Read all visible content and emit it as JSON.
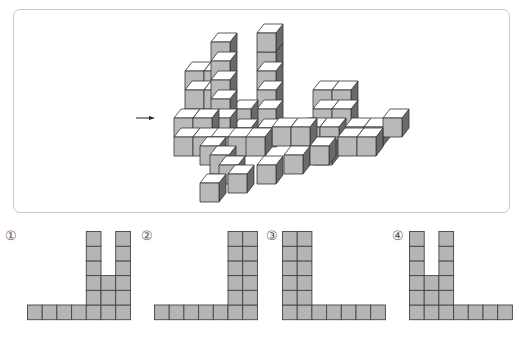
{
  "question": {
    "view_direction_arrow": "arrow-right",
    "cube_colors": {
      "front": "#b9b9b9",
      "top": "#ffffff",
      "side": "#6a6a6a",
      "edge": "#333333"
    },
    "cubes": [
      [
        257,
        52
      ],
      [
        257,
        71
      ],
      [
        257,
        90
      ],
      [
        257,
        109
      ],
      [
        257,
        128
      ],
      [
        257,
        33
      ],
      [
        185,
        71
      ],
      [
        204,
        71
      ],
      [
        185,
        90
      ],
      [
        204,
        90
      ],
      [
        232,
        109
      ],
      [
        232,
        128
      ],
      [
        211,
        42
      ],
      [
        211,
        61
      ],
      [
        211,
        80
      ],
      [
        211,
        99
      ],
      [
        211,
        118
      ],
      [
        313,
        90
      ],
      [
        332,
        90
      ],
      [
        313,
        109
      ],
      [
        332,
        109
      ],
      [
        301,
        127
      ],
      [
        320,
        127
      ],
      [
        345,
        127
      ],
      [
        364,
        127
      ],
      [
        383,
        118
      ],
      [
        174,
        118
      ],
      [
        193,
        118
      ],
      [
        174,
        137
      ],
      [
        193,
        137
      ],
      [
        211,
        137
      ],
      [
        272,
        127
      ],
      [
        291,
        127
      ],
      [
        228,
        137
      ],
      [
        246,
        137
      ],
      [
        313,
        146
      ],
      [
        338,
        137
      ],
      [
        357,
        137
      ],
      [
        200,
        146
      ],
      [
        210,
        155
      ],
      [
        219,
        165
      ],
      [
        284,
        155
      ],
      [
        257,
        165
      ],
      [
        310,
        146
      ],
      [
        228,
        174
      ],
      [
        200,
        183
      ]
    ]
  },
  "options": [
    {
      "label": "①",
      "heights": [
        1,
        1,
        1,
        1,
        6,
        3,
        6
      ]
    },
    {
      "label": "②",
      "heights": [
        1,
        1,
        1,
        1,
        1,
        6,
        6
      ]
    },
    {
      "label": "③",
      "heights": [
        6,
        6,
        1,
        1,
        1,
        1,
        1
      ]
    },
    {
      "label": "④",
      "heights": [
        6,
        3,
        6,
        1,
        1,
        1,
        1
      ]
    }
  ],
  "grid_colors": {
    "fill": "#b5b5b5",
    "stroke": "#444444"
  }
}
